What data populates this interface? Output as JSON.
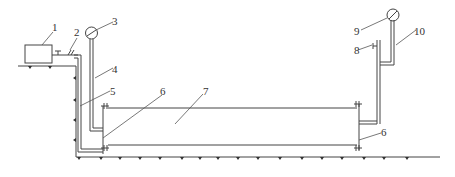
{
  "diagram": {
    "type": "pipeline test schematic",
    "labels": [
      {
        "id": "1",
        "text": "1"
      },
      {
        "id": "2",
        "text": "2"
      },
      {
        "id": "3",
        "text": "3"
      },
      {
        "id": "4",
        "text": "4"
      },
      {
        "id": "5",
        "text": "5"
      },
      {
        "id": "6a",
        "text": "6"
      },
      {
        "id": "7",
        "text": "7"
      },
      {
        "id": "6b",
        "text": "6"
      },
      {
        "id": "8",
        "text": "8"
      },
      {
        "id": "9",
        "text": "9"
      },
      {
        "id": "10",
        "text": "10"
      }
    ],
    "components": {
      "box": "pump-box",
      "valve": "valve",
      "gauge_left": "pressure-gauge",
      "gauge_right": "pressure-gauge",
      "pipe_main": "test-pipe"
    },
    "colors": {
      "line": "#444444",
      "background": "#ffffff"
    }
  }
}
